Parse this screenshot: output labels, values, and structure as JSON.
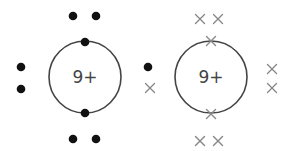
{
  "diagram": {
    "type": "dot-and-cross bonding diagram",
    "colors": {
      "shell": "#444444",
      "dot": "#111111",
      "cross": "#888888",
      "text": "#444444"
    },
    "atoms": [
      {
        "id": "atom-left",
        "nucleus_label": "9+",
        "center": [
          85,
          77
        ],
        "radius": 36,
        "electron_symbol": "dot"
      },
      {
        "id": "atom-right",
        "nucleus_label": "9+",
        "center": [
          211,
          77
        ],
        "radius": 36,
        "electron_symbol": "cross"
      }
    ],
    "left_electrons_dots": [
      [
        73,
        16
      ],
      [
        96,
        16
      ],
      [
        85,
        42
      ],
      [
        85,
        113
      ],
      [
        73,
        139
      ],
      [
        96,
        139
      ],
      [
        21,
        67
      ],
      [
        21,
        89
      ]
    ],
    "shared_pair": {
      "dot": [
        148,
        67
      ],
      "cross": [
        150,
        88
      ]
    },
    "right_electrons_crosses": [
      [
        200,
        19
      ],
      [
        218,
        19
      ],
      [
        211,
        41
      ],
      [
        211,
        114
      ],
      [
        200,
        141
      ],
      [
        218,
        141
      ],
      [
        272,
        69
      ],
      [
        272,
        88
      ]
    ]
  }
}
